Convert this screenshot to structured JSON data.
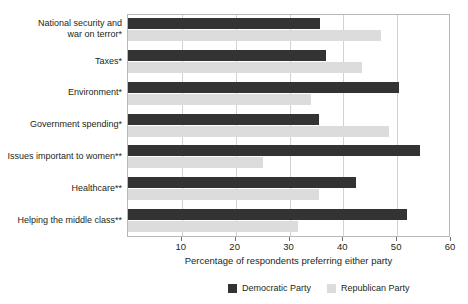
{
  "chart_data": {
    "type": "bar",
    "orientation": "horizontal",
    "title": "",
    "xlabel": "Percentage of respondents preferring either party",
    "ylabel": "",
    "xlim": [
      0,
      60
    ],
    "xticks": [
      10,
      20,
      30,
      40,
      50,
      60
    ],
    "grid": true,
    "legend_position": "bottom",
    "categories": [
      "National security and war on terror*",
      "Taxes*",
      "Environment*",
      "Government spending*",
      "Issues important to women**",
      "Healthcare**",
      "Helping the middle class**"
    ],
    "category_lines": [
      [
        "National security and",
        "war on terror*"
      ],
      [
        "Taxes*"
      ],
      [
        "Environment*"
      ],
      [
        "Government spending*"
      ],
      [
        "Issues important to women**"
      ],
      [
        "Healthcare**"
      ],
      [
        "Helping the middle class**"
      ]
    ],
    "series": [
      {
        "name": "Democratic Party",
        "color": "#333333",
        "values": [
          35.7,
          36.8,
          50.3,
          35.4,
          54.2,
          42.3,
          51.9
        ]
      },
      {
        "name": "Republican Party",
        "color": "#dcdcdc",
        "values": [
          47.0,
          43.4,
          34.0,
          48.4,
          25.0,
          35.4,
          31.5
        ]
      }
    ]
  },
  "legend": {
    "items": [
      {
        "label": "Democratic Party",
        "color": "#333333"
      },
      {
        "label": "Republican Party",
        "color": "#dcdcdc"
      }
    ]
  }
}
